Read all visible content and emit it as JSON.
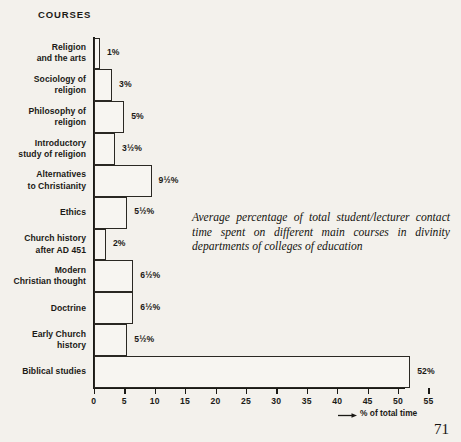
{
  "header": {
    "courses_label": "COURSES"
  },
  "caption": {
    "text": "Average percentage of total student/lecturer contact time spent on different main courses in divinity departments of colleges of education"
  },
  "page_number": "71",
  "axis": {
    "x_caption": "% of total time",
    "arrow_icon": "right-arrow-icon"
  },
  "chart_data": {
    "type": "bar",
    "orientation": "horizontal",
    "title": "COURSES",
    "xlabel": "% of total time",
    "ylabel": "",
    "xlim": [
      0,
      55
    ],
    "xticks": [
      0,
      5,
      10,
      15,
      20,
      25,
      30,
      35,
      40,
      45,
      50,
      55
    ],
    "xtick_labels": [
      "0",
      "5",
      "10",
      "15",
      "20",
      "25",
      "30",
      "35",
      "40",
      "45",
      "50",
      "55"
    ],
    "grid": false,
    "legend": false,
    "categories": [
      "Religion\nand the arts",
      "Sociology of\nreligion",
      "Philosophy of\nreligion",
      "Introductory\nstudy of religion",
      "Alternatives\nto Christianity",
      "Ethics",
      "Church history\nafter AD 451",
      "Modern\nChristian thought",
      "Doctrine",
      "Early Church\nhistory",
      "Biblical studies"
    ],
    "values": [
      1,
      3,
      5,
      3.5,
      9.5,
      5.5,
      2,
      6.5,
      6.5,
      5.5,
      52
    ],
    "value_labels": [
      "1%",
      "3%",
      "5%",
      "3½%",
      "9½%",
      "5½%",
      "2%",
      "6½%",
      "6½%",
      "5½%",
      "52%"
    ]
  }
}
